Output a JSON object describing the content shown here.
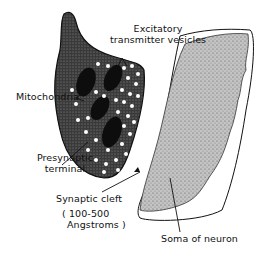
{
  "diagram": {
    "colors": {
      "ink": "#111111",
      "terminal_fill": "#2a2a2a",
      "soma_fill": "#b9b9b9",
      "background": "#ffffff"
    },
    "labels": {
      "vesicles_line1": "Excitatory",
      "vesicles_line2": "transmitter vesicles",
      "mitochondria": "Mitochondria",
      "presynaptic_line1": "Presynaptic",
      "presynaptic_line2": "terminal",
      "cleft": "Synaptic cleft",
      "cleft_size_line1": "( 100-500",
      "cleft_size_line2": "Angstroms )",
      "soma": "Soma of neuron"
    },
    "structures": [
      {
        "name": "presynaptic-terminal",
        "description": "dark stippled bulb with white vesicles"
      },
      {
        "name": "mitochondria",
        "count": 4
      },
      {
        "name": "synaptic-cleft",
        "description": "narrow gap between terminal and soma"
      },
      {
        "name": "soma",
        "description": "grey stippled cell body with outer membrane outline"
      }
    ]
  }
}
